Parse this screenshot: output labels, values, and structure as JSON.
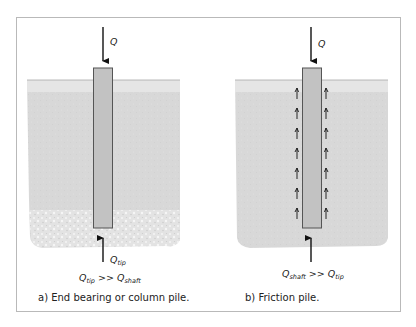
{
  "panels": [
    {
      "id": "a",
      "load_label": "Q",
      "tip_label_main": "Q",
      "tip_label_sub": "tip",
      "relation": {
        "left_main": "Q",
        "left_sub": "tip",
        "op": ">>",
        "right_main": "Q",
        "right_sub": "shaft"
      },
      "caption": "a) End bearing or column pile."
    },
    {
      "id": "b",
      "load_label": "Q",
      "relation": {
        "left_main": "Q",
        "left_sub": "shaft",
        "op": ">>",
        "right_main": "Q",
        "right_sub": "tip"
      },
      "caption": "b) Friction pile."
    }
  ],
  "colors": {
    "frame": "#b9b9b9",
    "soil": "#d9d9d9",
    "soil_top_band": "#e4e4e4",
    "gravel": "#e6e6e6",
    "pile_fill": "#c4c4c4",
    "pile_stroke": "#555555",
    "arrow": "#111111"
  }
}
